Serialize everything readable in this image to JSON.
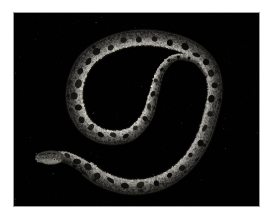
{
  "page": {
    "type": "photograph",
    "background_color": "#ffffff",
    "width": 276,
    "height": 224
  },
  "photo": {
    "alt_description": "Photograph of a coiled snake with dark dorsal blotches on a black background",
    "subject": "snake",
    "frame": {
      "left": 13,
      "top": 12,
      "width": 247,
      "height": 195,
      "border_color": "#9b9b9b",
      "border_width": 1
    },
    "background_color": "#010101",
    "palette": {
      "background": "#010101",
      "body_dark": "#2a2a28",
      "body_mid": "#6e6b64",
      "body_light": "#b9b5ab",
      "body_highlight": "#e8e6de",
      "blotch": "#0a0a09",
      "speckle": "#d8d4ca"
    },
    "lighting": "high-contrast flash on dark background",
    "caption": ""
  },
  "snake": {
    "pose": "coiled in overlapping loops",
    "head_position": {
      "x": 48,
      "y": 158,
      "facing": "left"
    },
    "tail_position": {
      "x": 232,
      "y": 130
    },
    "segment_count": 6,
    "marking_style": "dark saddle blotches along dorsal midline",
    "blotch_count": 46,
    "spine_path": [
      {
        "x": 0.152,
        "y": 0.76
      },
      {
        "x": 0.205,
        "y": 0.745
      },
      {
        "x": 0.28,
        "y": 0.79
      },
      {
        "x": 0.36,
        "y": 0.86
      },
      {
        "x": 0.47,
        "y": 0.9
      },
      {
        "x": 0.59,
        "y": 0.88
      },
      {
        "x": 0.69,
        "y": 0.8
      },
      {
        "x": 0.76,
        "y": 0.68
      },
      {
        "x": 0.8,
        "y": 0.54
      },
      {
        "x": 0.82,
        "y": 0.4
      },
      {
        "x": 0.8,
        "y": 0.28
      },
      {
        "x": 0.73,
        "y": 0.19
      },
      {
        "x": 0.62,
        "y": 0.14
      },
      {
        "x": 0.5,
        "y": 0.13
      },
      {
        "x": 0.39,
        "y": 0.165
      },
      {
        "x": 0.3,
        "y": 0.24
      },
      {
        "x": 0.255,
        "y": 0.35
      },
      {
        "x": 0.25,
        "y": 0.47
      },
      {
        "x": 0.29,
        "y": 0.58
      },
      {
        "x": 0.37,
        "y": 0.64
      },
      {
        "x": 0.47,
        "y": 0.63
      },
      {
        "x": 0.54,
        "y": 0.54
      },
      {
        "x": 0.57,
        "y": 0.42
      },
      {
        "x": 0.6,
        "y": 0.3
      },
      {
        "x": 0.66,
        "y": 0.23
      },
      {
        "x": 0.74,
        "y": 0.25
      },
      {
        "x": 0.79,
        "y": 0.33
      }
    ]
  }
}
